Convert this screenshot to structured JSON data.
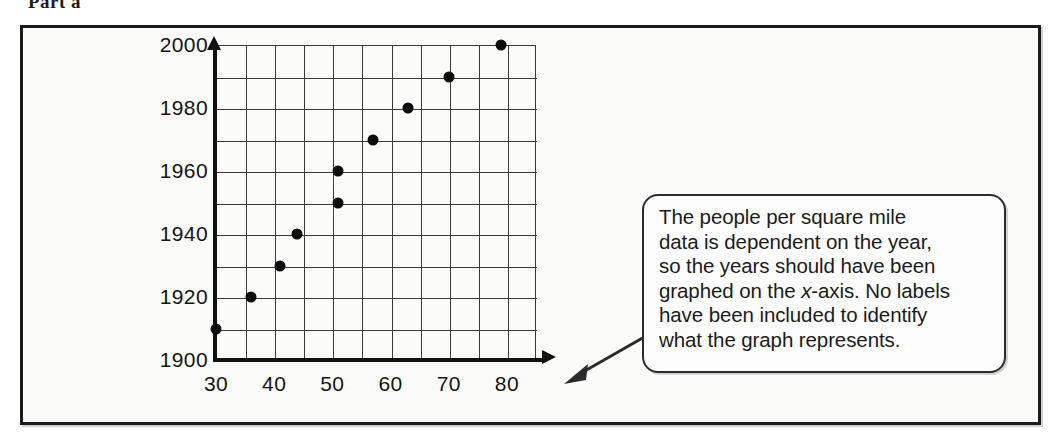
{
  "page": {
    "cropped_header": "Part a"
  },
  "callout": {
    "line1": "The people per square mile",
    "line2": "data is dependent on the year,",
    "line3": "so the years should have been",
    "line4_pre": "graphed on the ",
    "line4_ital": "x",
    "line4_post": "-axis. No labels",
    "line5": "have been included to identify",
    "line6": "what the graph represents.",
    "full_text": "The people per square mile data is dependent on the year, so the years should have been graphed on the x-axis. No labels have been included to identify what the graph represents."
  },
  "colors": {
    "ink": "#141414",
    "dot": "#0d0d0d",
    "grid": "#3a3a3a",
    "axis": "#111111",
    "frame": "#1a1a1a",
    "paper": "#fbfbfa",
    "callout_bg": "#fdfdfd"
  },
  "chart_data": {
    "type": "scatter",
    "title": "",
    "xlabel": "",
    "ylabel": "",
    "xlim": [
      30,
      85
    ],
    "ylim": [
      1900,
      2000
    ],
    "grid": true,
    "legend": "none",
    "xticks": [
      30,
      40,
      50,
      60,
      70,
      80
    ],
    "xtick_labels": [
      "30",
      "40",
      "50",
      "60",
      "70",
      "80"
    ],
    "yticks": [
      1900,
      1920,
      1940,
      1960,
      1980,
      2000
    ],
    "ytick_labels": [
      "1900",
      "1920",
      "1940",
      "1960",
      "1980",
      "2000"
    ],
    "x_gridline_step": 5,
    "y_gridline_step": 10,
    "x": [
      30,
      36,
      41,
      44,
      51,
      51,
      57,
      63,
      70,
      79
    ],
    "y": [
      1910,
      1920,
      1930,
      1940,
      1950,
      1960,
      1970,
      1980,
      1990,
      2000
    ],
    "points": [
      {
        "x": 30,
        "y": 1910
      },
      {
        "x": 36,
        "y": 1920
      },
      {
        "x": 41,
        "y": 1930
      },
      {
        "x": 44,
        "y": 1940
      },
      {
        "x": 51,
        "y": 1950
      },
      {
        "x": 51,
        "y": 1960
      },
      {
        "x": 57,
        "y": 1970
      },
      {
        "x": 63,
        "y": 1980
      },
      {
        "x": 70,
        "y": 1990
      },
      {
        "x": 79,
        "y": 2000
      }
    ]
  }
}
